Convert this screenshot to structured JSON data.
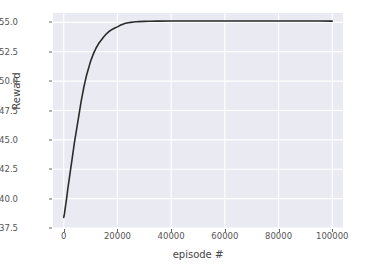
{
  "chart_data": {
    "type": "line",
    "title": "",
    "xlabel": "episode #",
    "ylabel": "Reward",
    "xlim": [
      -4000,
      104000
    ],
    "ylim": [
      37.5,
      55.8
    ],
    "grid": true,
    "legend": null,
    "xticks": [
      0,
      20000,
      40000,
      60000,
      80000,
      100000
    ],
    "xtick_labels": [
      "0",
      "20000",
      "40000",
      "60000",
      "80000",
      "100000"
    ],
    "yticks": [
      37.5,
      40.0,
      42.5,
      45.0,
      47.5,
      50.0,
      52.5,
      55.0
    ],
    "ytick_labels": [
      "37.5",
      "40.0",
      "42.5",
      "45.0",
      "47.5",
      "50.0",
      "52.5",
      "55.0"
    ],
    "series": [
      {
        "name": "reward",
        "color": "#2b2b2b",
        "linewidth": 1.6,
        "x": [
          0,
          250,
          500,
          750,
          1000,
          1500,
          2000,
          2500,
          3000,
          3500,
          4000,
          4500,
          5000,
          5500,
          6000,
          6500,
          7000,
          7500,
          8000,
          8500,
          9000,
          9500,
          10000,
          11000,
          12000,
          13000,
          14000,
          15000,
          16000,
          17000,
          18000,
          19000,
          20000,
          21000,
          22000,
          23000,
          24000,
          25000,
          26000,
          27000,
          28000,
          30000,
          32000,
          35000,
          40000,
          45000,
          50000,
          55000,
          60000,
          65000,
          70000,
          75000,
          80000,
          85000,
          90000,
          95000,
          100000
        ],
        "y": [
          38.4,
          38.7,
          39.1,
          39.5,
          39.9,
          40.8,
          41.6,
          42.4,
          43.2,
          44.0,
          44.8,
          45.5,
          46.2,
          46.9,
          47.6,
          48.3,
          48.9,
          49.5,
          50.0,
          50.5,
          50.9,
          51.3,
          51.7,
          52.3,
          52.8,
          53.2,
          53.5,
          53.8,
          54.05,
          54.25,
          54.4,
          54.52,
          54.62,
          54.75,
          54.85,
          54.92,
          54.97,
          55.0,
          55.03,
          55.05,
          55.07,
          55.09,
          55.1,
          55.11,
          55.12,
          55.12,
          55.12,
          55.12,
          55.12,
          55.12,
          55.12,
          55.12,
          55.12,
          55.12,
          55.12,
          55.12,
          55.11
        ]
      }
    ],
    "style": {
      "axes_facecolor": "#eaeaf2",
      "figure_facecolor": "#ffffff",
      "gridline_color": "#ffffff",
      "tick_label_color": "#555555",
      "axis_label_color": "#444444"
    }
  }
}
